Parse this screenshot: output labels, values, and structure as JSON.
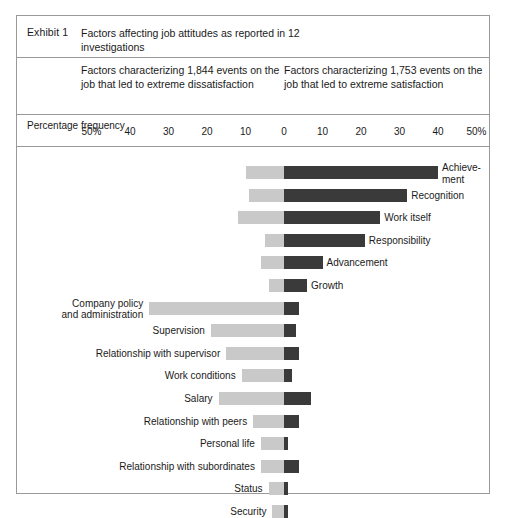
{
  "exhibit": {
    "number_label": "Exhibit 1",
    "title": "Factors affecting job attitudes as reported in 12 investigations",
    "column_left": "Factors characterizing 1,844 events on the job that led to extreme dissatisfaction",
    "column_right": "Factors characterizing 1,753 events on the job that led to extreme satisfaction",
    "axis_caption": "Percentage frequency"
  },
  "chart_data": {
    "type": "bar",
    "orientation": "horizontal",
    "layout": "diverging-bidirectional",
    "title": "Factors affecting job attitudes as reported in 12 investigations",
    "xlabel": "Percentage frequency",
    "ylabel": "",
    "xlim": [
      -50,
      50
    ],
    "grid": false,
    "legend": [
      "Factors characterizing 1,844 events on the job that led to extreme dissatisfaction",
      "Factors characterizing 1,753 events on the job that led to extreme satisfaction"
    ],
    "tick_labels_left": [
      "50%",
      "40",
      "30",
      "20",
      "10",
      "0"
    ],
    "tick_labels_right": [
      "0",
      "10",
      "20",
      "30",
      "40",
      "50%"
    ],
    "tick_values": [
      -50,
      -40,
      -30,
      -20,
      -10,
      0,
      10,
      20,
      30,
      40,
      50
    ],
    "colors": {
      "dissatisfaction": "#c9c9c9",
      "satisfaction": "#3a3a3a"
    },
    "series": [
      {
        "name": "Dissatisfaction (frequency %)",
        "color": "#c9c9c9"
      },
      {
        "name": "Satisfaction (frequency %)",
        "color": "#3a3a3a"
      }
    ],
    "categories": [
      "Achievement",
      "Recognition",
      "Work itself",
      "Responsibility",
      "Advancement",
      "Growth",
      "Company policy and administration",
      "Supervision",
      "Relationship with supervisor",
      "Work conditions",
      "Salary",
      "Relationship with peers",
      "Personal life",
      "Relationship with subordinates",
      "Status",
      "Security"
    ],
    "rows": [
      {
        "label": "Achieve- ment",
        "label_display": "Achieve-\nment",
        "dissatisfaction": 10,
        "satisfaction": 40,
        "label_side": "right"
      },
      {
        "label": "Recognition",
        "label_display": "Recognition",
        "dissatisfaction": 9,
        "satisfaction": 32,
        "label_side": "right"
      },
      {
        "label": "Work itself",
        "label_display": "Work itself",
        "dissatisfaction": 12,
        "satisfaction": 25,
        "label_side": "right"
      },
      {
        "label": "Responsibility",
        "label_display": "Responsibility",
        "dissatisfaction": 5,
        "satisfaction": 21,
        "label_side": "right"
      },
      {
        "label": "Advancement",
        "label_display": "Advancement",
        "dissatisfaction": 6,
        "satisfaction": 10,
        "label_side": "right"
      },
      {
        "label": "Growth",
        "label_display": "Growth",
        "dissatisfaction": 4,
        "satisfaction": 6,
        "label_side": "right"
      },
      {
        "label": "Company policy and administration",
        "label_display": "Company policy and administration",
        "dissatisfaction": 35,
        "satisfaction": 4,
        "label_side": "left"
      },
      {
        "label": "Supervision",
        "label_display": "Supervision",
        "dissatisfaction": 19,
        "satisfaction": 3,
        "label_side": "left"
      },
      {
        "label": "Relationship with supervisor",
        "label_display": "Relationship with supervisor",
        "dissatisfaction": 15,
        "satisfaction": 4,
        "label_side": "left"
      },
      {
        "label": "Work conditions",
        "label_display": "Work conditions",
        "dissatisfaction": 11,
        "satisfaction": 2,
        "label_side": "left"
      },
      {
        "label": "Salary",
        "label_display": "Salary",
        "dissatisfaction": 17,
        "satisfaction": 7,
        "label_side": "left"
      },
      {
        "label": "Relationship with peers",
        "label_display": "Relationship with peers",
        "dissatisfaction": 8,
        "satisfaction": 4,
        "label_side": "left"
      },
      {
        "label": "Personal life",
        "label_display": "Personal life",
        "dissatisfaction": 6,
        "satisfaction": 1,
        "label_side": "left"
      },
      {
        "label": "Relationship with subordinates",
        "label_display": "Relationship with subordinates",
        "dissatisfaction": 6,
        "satisfaction": 4,
        "label_side": "left"
      },
      {
        "label": "Status",
        "label_display": "Status",
        "dissatisfaction": 4,
        "satisfaction": 1,
        "label_side": "left"
      },
      {
        "label": "Security",
        "label_display": "Security",
        "dissatisfaction": 3,
        "satisfaction": 1,
        "label_side": "left"
      }
    ]
  }
}
